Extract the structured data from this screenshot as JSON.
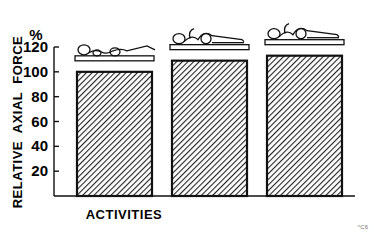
{
  "chart_data": {
    "type": "bar",
    "title": "",
    "xlabel": "ACTIVITIES",
    "ylabel": "RELATIVE  AXIAL  FORCE",
    "yunit": "%",
    "ylim": [
      0,
      120
    ],
    "yticks": [
      20,
      40,
      60,
      80,
      100,
      120
    ],
    "categories": [
      "Lying supine, legs flat",
      "Lying supine, hips and knees flexed",
      "Lying supine, hips flexed, legs elevated"
    ],
    "values": [
      100,
      109,
      113
    ],
    "fill_pattern": "diagonal hatch",
    "grid": false,
    "legend": "none",
    "footnote": "^C6"
  },
  "colors": {
    "ink": "#111111",
    "background": "#ffffff"
  }
}
